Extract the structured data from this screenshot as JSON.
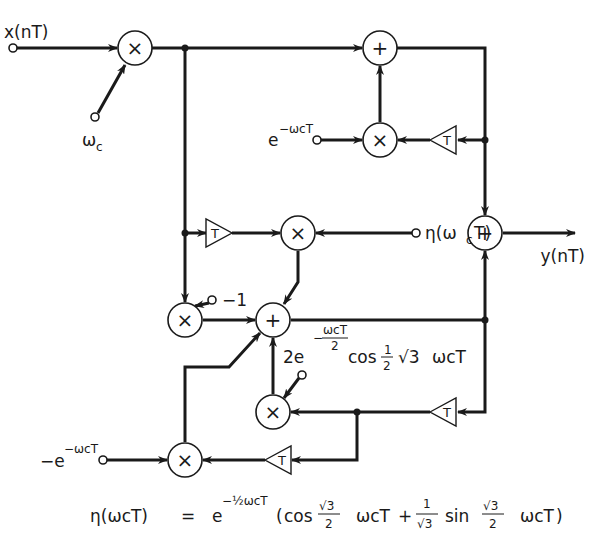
{
  "diagram": {
    "type": "signal-flow block diagram",
    "input_label": "x(nT)",
    "output_label": "y(nT)",
    "inputs": {
      "carrier": "ωc",
      "top_coeff": "e^{-ωcT}",
      "eta_coeff": "η(ωcT)",
      "minus_one": "-1",
      "mid_coeff": "2e^{-ωcT/2} cos(½√3 ωcT)",
      "bottom_coeff": "-e^{-ωcT}"
    },
    "node_symbols": {
      "multiplier": "×",
      "adder": "+",
      "delay": "T"
    },
    "nodes": [
      {
        "id": "M1",
        "kind": "multiplier"
      },
      {
        "id": "A1",
        "kind": "adder"
      },
      {
        "id": "M2",
        "kind": "multiplier"
      },
      {
        "id": "D1",
        "kind": "delay"
      },
      {
        "id": "A_out",
        "kind": "adder"
      },
      {
        "id": "D2",
        "kind": "delay"
      },
      {
        "id": "M3",
        "kind": "multiplier"
      },
      {
        "id": "M4",
        "kind": "multiplier"
      },
      {
        "id": "A2",
        "kind": "adder"
      },
      {
        "id": "M5",
        "kind": "multiplier"
      },
      {
        "id": "D3",
        "kind": "delay"
      },
      {
        "id": "M6",
        "kind": "multiplier"
      },
      {
        "id": "D4",
        "kind": "delay"
      }
    ],
    "equation": {
      "lhs": "η(ωcT)",
      "equals": "=",
      "rhs": "e^{-½ωcT} (cos(√3/2 ωcT) + (1/√3) sin(√3/2 ωcT))"
    }
  },
  "labels": {
    "x_in": "x(nT)",
    "y_out": "y(nT)",
    "omega": "ω",
    "c": "c",
    "T": "T",
    "e": "e",
    "neg_e": "−e",
    "exp_neg_wcT": "−ωcT",
    "w": "ω",
    "eta": "η(ω",
    "eta_close": "T)",
    "minus1": "−1",
    "two_e": "2e",
    "minus": "−",
    "wcT_frac_num": "ωcT",
    "frac_den_2": "2",
    "cos": "cos",
    "one": "1",
    "sqrt3": "√3",
    "wcT": "ωcT",
    "sin": "sin",
    "plus": "+",
    "lparen": "(",
    "rparen": ")",
    "eq_lhs": "η(ωcT)",
    "eq_equals": "=",
    "eq_e": "e",
    "eq_exp": "−½ωcT"
  }
}
